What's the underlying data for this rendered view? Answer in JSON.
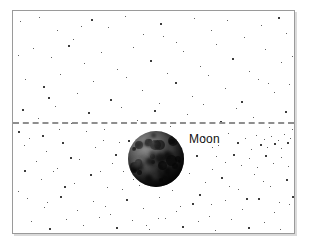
{
  "figure": {
    "title": "",
    "background_color": "#ffffff",
    "frame": {
      "border_color": "#9a9a9a",
      "x": 12,
      "y": 10,
      "width": 283,
      "height": 224
    }
  },
  "labels": {
    "moon": "Moon"
  },
  "annotations": {
    "moon_label": {
      "text": "Moon",
      "x": 188,
      "y": 131,
      "color": "#111111",
      "font_size_px": 12
    }
  },
  "chart_data": {
    "type": "scatter",
    "title": "",
    "subtitle": "",
    "xlabel": "",
    "ylabel": "",
    "grid": false,
    "legend_position": "none",
    "xlim": [
      0,
      281
    ],
    "ylim": [
      0,
      222
    ],
    "series": [
      {
        "name": "stars",
        "marker": "square-dot",
        "color": "#2b2b2b",
        "points": [
          [
            7,
            10,
            1
          ],
          [
            26,
            6,
            1
          ],
          [
            44,
            19,
            1
          ],
          [
            60,
            28,
            1
          ],
          [
            78,
            8,
            2
          ],
          [
            95,
            16,
            1
          ],
          [
            112,
            5,
            1
          ],
          [
            130,
            23,
            1
          ],
          [
            147,
            12,
            2
          ],
          [
            163,
            31,
            1
          ],
          [
            181,
            7,
            1
          ],
          [
            198,
            19,
            1
          ],
          [
            214,
            9,
            1
          ],
          [
            231,
            26,
            1
          ],
          [
            248,
            14,
            1
          ],
          [
            265,
            6,
            2
          ],
          [
            273,
            22,
            1
          ],
          [
            20,
            37,
            1
          ],
          [
            38,
            46,
            1
          ],
          [
            55,
            34,
            2
          ],
          [
            71,
            52,
            1
          ],
          [
            88,
            41,
            1
          ],
          [
            104,
            58,
            1
          ],
          [
            120,
            36,
            1
          ],
          [
            137,
            49,
            2
          ],
          [
            154,
            62,
            1
          ],
          [
            170,
            40,
            1
          ],
          [
            187,
            55,
            1
          ],
          [
            203,
            33,
            1
          ],
          [
            219,
            47,
            2
          ],
          [
            236,
            60,
            1
          ],
          [
            252,
            38,
            1
          ],
          [
            268,
            51,
            1
          ],
          [
            12,
            68,
            1
          ],
          [
            30,
            75,
            2
          ],
          [
            47,
            63,
            1
          ],
          [
            64,
            82,
            1
          ],
          [
            80,
            70,
            1
          ],
          [
            97,
            88,
            2
          ],
          [
            113,
            66,
            1
          ],
          [
            129,
            79,
            1
          ],
          [
            146,
            92,
            1
          ],
          [
            162,
            71,
            2
          ],
          [
            179,
            85,
            1
          ],
          [
            195,
            64,
            1
          ],
          [
            212,
            77,
            1
          ],
          [
            228,
            90,
            2
          ],
          [
            245,
            68,
            1
          ],
          [
            261,
            81,
            1
          ],
          [
            276,
            73,
            1
          ],
          [
            9,
            98,
            2
          ],
          [
            25,
            107,
            1
          ],
          [
            42,
            95,
            1
          ],
          [
            58,
            112,
            1
          ],
          [
            75,
            101,
            2
          ],
          [
            91,
            118,
            1
          ],
          [
            108,
            96,
            1
          ],
          [
            124,
            109,
            1
          ],
          [
            141,
            99,
            2
          ],
          [
            157,
            115,
            1
          ],
          [
            174,
            103,
            1
          ],
          [
            190,
            93,
            1
          ],
          [
            207,
            110,
            2
          ],
          [
            223,
            97,
            1
          ],
          [
            240,
            106,
            1
          ],
          [
            256,
            116,
            1
          ],
          [
            272,
            100,
            2
          ],
          [
            16,
            127,
            1
          ],
          [
            33,
            140,
            1
          ],
          [
            49,
            131,
            2
          ],
          [
            66,
            148,
            1
          ],
          [
            82,
            136,
            1
          ],
          [
            99,
            152,
            1
          ],
          [
            115,
            129,
            2
          ],
          [
            190,
            126,
            1
          ],
          [
            205,
            134,
            1
          ],
          [
            215,
            122,
            1
          ],
          [
            224,
            131,
            2
          ],
          [
            232,
            127,
            1
          ],
          [
            238,
            138,
            1
          ],
          [
            243,
            124,
            1
          ],
          [
            247,
            133,
            2
          ],
          [
            251,
            128,
            1
          ],
          [
            254,
            136,
            1
          ],
          [
            258,
            125,
            1
          ],
          [
            261,
            132,
            2
          ],
          [
            265,
            129,
            1
          ],
          [
            268,
            137,
            1
          ],
          [
            271,
            123,
            1
          ],
          [
            274,
            131,
            2
          ],
          [
            277,
            127,
            1
          ],
          [
            203,
            145,
            1
          ],
          [
            212,
            151,
            1
          ],
          [
            220,
            143,
            2
          ],
          [
            228,
            154,
            1
          ],
          [
            236,
            147,
            1
          ],
          [
            244,
            156,
            1
          ],
          [
            252,
            144,
            2
          ],
          [
            260,
            152,
            1
          ],
          [
            268,
            146,
            1
          ],
          [
            275,
            155,
            1
          ],
          [
            11,
            159,
            2
          ],
          [
            28,
            168,
            1
          ],
          [
            44,
            157,
            1
          ],
          [
            61,
            172,
            1
          ],
          [
            77,
            163,
            2
          ],
          [
            94,
            176,
            1
          ],
          [
            110,
            160,
            1
          ],
          [
            126,
            174,
            1
          ],
          [
            143,
            165,
            2
          ],
          [
            159,
            179,
            1
          ],
          [
            176,
            162,
            1
          ],
          [
            192,
            171,
            1
          ],
          [
            208,
            166,
            2
          ],
          [
            225,
            178,
            1
          ],
          [
            241,
            163,
            1
          ],
          [
            257,
            175,
            1
          ],
          [
            273,
            168,
            2
          ],
          [
            14,
            187,
            1
          ],
          [
            31,
            196,
            1
          ],
          [
            47,
            185,
            2
          ],
          [
            64,
            199,
            1
          ],
          [
            80,
            190,
            1
          ],
          [
            97,
            203,
            1
          ],
          [
            113,
            188,
            2
          ],
          [
            130,
            197,
            1
          ],
          [
            146,
            186,
            1
          ],
          [
            163,
            200,
            1
          ],
          [
            179,
            192,
            2
          ],
          [
            196,
            205,
            1
          ],
          [
            212,
            189,
            1
          ],
          [
            229,
            198,
            1
          ],
          [
            245,
            187,
            2
          ],
          [
            261,
            201,
            1
          ],
          [
            276,
            193,
            1
          ],
          [
            18,
            210,
            1
          ],
          [
            36,
            217,
            2
          ],
          [
            53,
            208,
            1
          ],
          [
            70,
            214,
            1
          ],
          [
            86,
            206,
            1
          ],
          [
            103,
            216,
            2
          ],
          [
            119,
            209,
            1
          ],
          [
            136,
            218,
            1
          ],
          [
            152,
            207,
            1
          ],
          [
            169,
            215,
            2
          ],
          [
            185,
            210,
            1
          ],
          [
            202,
            219,
            1
          ],
          [
            218,
            208,
            1
          ],
          [
            235,
            216,
            2
          ],
          [
            251,
            211,
            1
          ],
          [
            267,
            218,
            1
          ],
          [
            5,
            44,
            1
          ],
          [
            5,
            120,
            2
          ],
          [
            5,
            180,
            1
          ],
          [
            279,
            45,
            1
          ],
          [
            279,
            118,
            1
          ],
          [
            279,
            185,
            2
          ],
          [
            150,
            25,
            1
          ],
          [
            68,
            15,
            1
          ],
          [
            255,
            72,
            1
          ],
          [
            35,
            86,
            2
          ],
          [
            118,
            142,
            1
          ],
          [
            106,
            131,
            1
          ],
          [
            199,
            158,
            1
          ],
          [
            186,
            183,
            2
          ],
          [
            145,
            207,
            1
          ],
          [
            90,
            129,
            1
          ],
          [
            73,
            120,
            1
          ],
          [
            57,
            146,
            2
          ],
          [
            40,
            160,
            1
          ],
          [
            23,
            150,
            1
          ],
          [
            87,
            160,
            1
          ],
          [
            102,
            143,
            2
          ],
          [
            120,
            168,
            1
          ],
          [
            198,
            193,
            1
          ],
          [
            216,
            175,
            1
          ],
          [
            233,
            187,
            2
          ],
          [
            250,
            170,
            1
          ],
          [
            266,
            191,
            1
          ],
          [
            11,
            134,
            1
          ],
          [
            29,
            124,
            2
          ],
          [
            46,
            118,
            1
          ],
          [
            151,
            137,
            1
          ],
          [
            167,
            150,
            1
          ],
          [
            183,
            144,
            2
          ],
          [
            199,
            136,
            1
          ],
          [
            133,
            214,
            1
          ],
          [
            167,
            195,
            1
          ],
          [
            51,
            175,
            2
          ],
          [
            34,
            191,
            1
          ],
          [
            109,
            178,
            1
          ],
          [
            92,
            195,
            1
          ]
        ]
      }
    ],
    "reference_lines": [
      {
        "name": "ecliptic",
        "orientation": "horizontal",
        "y": 111,
        "style": "dashed",
        "color": "#8e8e8e",
        "width_px": 2
      }
    ],
    "objects": [
      {
        "name": "moon",
        "label": "Moon",
        "shape": "sphere",
        "cx": 143,
        "cy": 148,
        "radius": 28,
        "color": "#2c2c2c",
        "highlight_color": "#7a7a7a"
      }
    ]
  }
}
